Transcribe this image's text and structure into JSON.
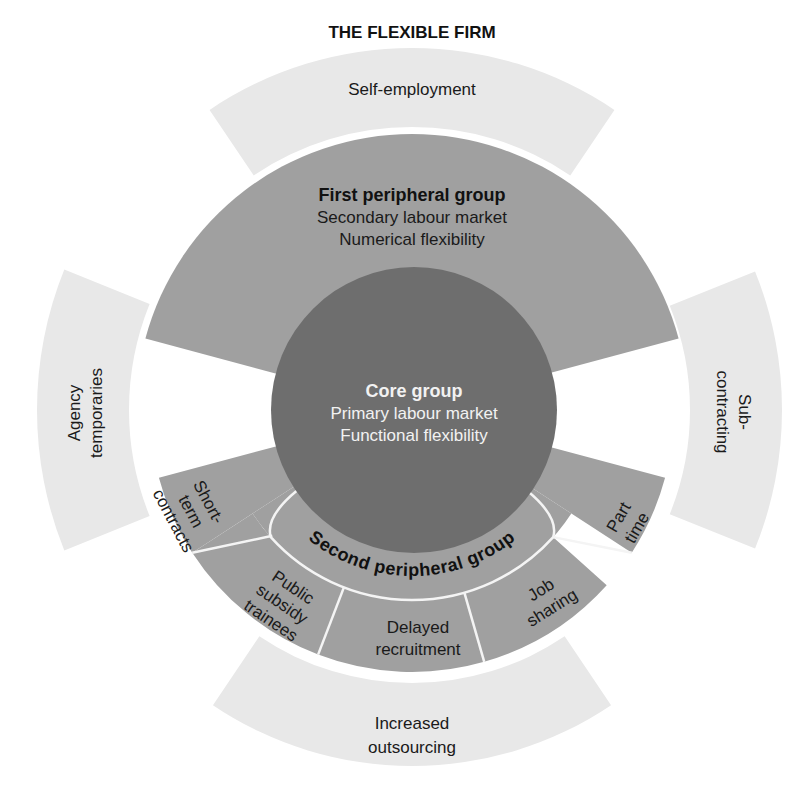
{
  "title": "THE FLEXIBLE FIRM",
  "colors": {
    "core": "#6e6e6e",
    "peripheral": "#a0a0a0",
    "outer_band": "#e8e8e8",
    "divider": "#f4f4f4",
    "dark_text": "#111111",
    "light_text": "#f2f2f2"
  },
  "core_group": {
    "title": "Core group",
    "line1": "Primary labour market",
    "line2": "Functional flexibility"
  },
  "first_peripheral_group": {
    "title": "First peripheral group",
    "line1": "Secondary labour market",
    "line2": "Numerical flexibility"
  },
  "second_peripheral_group": {
    "title": "Second peripheral group",
    "segments": [
      {
        "id": "short-term-contracts",
        "lines": [
          "Short-",
          "term",
          "contracts"
        ]
      },
      {
        "id": "public-subsidy-trainees",
        "lines": [
          "Public",
          "subsidy",
          "trainees"
        ]
      },
      {
        "id": "delayed-recruitment",
        "lines": [
          "Delayed",
          "recruitment"
        ]
      },
      {
        "id": "job-sharing",
        "lines": [
          "Job",
          "sharing"
        ]
      },
      {
        "id": "part-time",
        "lines": [
          "Part",
          "time"
        ]
      }
    ]
  },
  "outer_bands": {
    "top": {
      "lines": [
        "Self-employment"
      ]
    },
    "left": {
      "lines": [
        "Agency",
        "temporaries"
      ]
    },
    "right": {
      "lines": [
        "Sub-",
        "contracting"
      ]
    },
    "bottom": {
      "lines": [
        "Increased",
        "outsourcing"
      ]
    }
  }
}
